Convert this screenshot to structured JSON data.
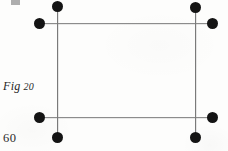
{
  "page": {
    "width": 228,
    "height": 151,
    "background_color": "#fdfdfc",
    "ink_color": "#141414",
    "rule_color": "#8c8c8c"
  },
  "labels": {
    "figure_caption": "Fig",
    "figure_number": "20",
    "folio_number": "60"
  },
  "figure": {
    "name": "rectangle-of-four-crossed-rules",
    "dot_count": 8,
    "rules": [
      {
        "id": "rule-top",
        "orientation": "horizontal",
        "x1": 39,
        "y1": 23,
        "x2": 212,
        "y2": 23
      },
      {
        "id": "rule-bottom",
        "orientation": "horizontal",
        "x1": 39,
        "y1": 117,
        "x2": 212,
        "y2": 117
      },
      {
        "id": "rule-left",
        "orientation": "vertical",
        "x1": 57,
        "y1": 6,
        "x2": 57,
        "y2": 137
      },
      {
        "id": "rule-right",
        "orientation": "vertical",
        "x1": 195,
        "y1": 7,
        "x2": 195,
        "y2": 137
      }
    ],
    "dots": [
      {
        "id": "dot-top-left-upper",
        "x": 57,
        "y": 6
      },
      {
        "id": "dot-top-right-upper",
        "x": 195,
        "y": 7
      },
      {
        "id": "dot-top-left-outer",
        "x": 39,
        "y": 23
      },
      {
        "id": "dot-top-right-outer",
        "x": 212,
        "y": 23
      },
      {
        "id": "dot-bottom-left-outer",
        "x": 39,
        "y": 117
      },
      {
        "id": "dot-bottom-right-outer",
        "x": 212,
        "y": 117
      },
      {
        "id": "dot-bottom-left-lower",
        "x": 57,
        "y": 137
      },
      {
        "id": "dot-bottom-right-lower",
        "x": 195,
        "y": 137
      }
    ]
  }
}
